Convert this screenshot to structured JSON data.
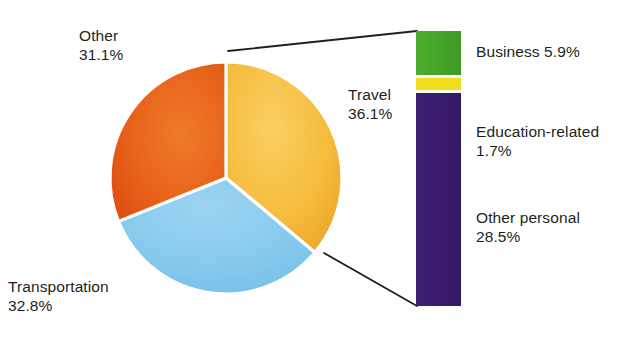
{
  "chart_data": {
    "type": "pie",
    "title": "",
    "subtitle": "",
    "xlabel": "",
    "ylabel": "",
    "legend_position": "right",
    "grid": false,
    "units": "percent",
    "categories": [
      "Travel",
      "Transportation",
      "Other"
    ],
    "values": [
      36.1,
      32.8,
      31.1
    ],
    "colors": [
      "#f5bc3c",
      "#82c8ec",
      "#e8631a"
    ],
    "start_angle_deg": 0,
    "direction": "clockwise",
    "exploded_category": "Travel",
    "breakout": {
      "type": "bar",
      "orientation": "vertical-stacked",
      "of_category": "Travel",
      "total": 36.1,
      "categories": [
        "Business",
        "Education-related",
        "Other personal"
      ],
      "values": [
        5.9,
        1.7,
        28.5
      ],
      "colors": [
        "#45a52a",
        "#f2dd1e",
        "#3b1c6e"
      ]
    }
  },
  "pie": {
    "slices": [
      {
        "name": "travel",
        "label": "Travel",
        "percent": "36.1%",
        "color": "#f5bc3c"
      },
      {
        "name": "transportation",
        "label": "Transportation",
        "percent": "32.8%",
        "color": "#82c8ec"
      },
      {
        "name": "other",
        "label": "Other",
        "percent": "31.1%",
        "color": "#e8631a"
      }
    ]
  },
  "bar": {
    "segments": [
      {
        "name": "business",
        "label": "Business",
        "percent": "5.9%",
        "color": "#45a52a"
      },
      {
        "name": "education-related",
        "label": "Education-related",
        "percent": "1.7%",
        "color": "#f2dd1e"
      },
      {
        "name": "other-personal",
        "label": "Other personal",
        "percent": "28.5%",
        "color": "#3b1c6e"
      }
    ]
  },
  "labels": {
    "other_line1": "Other",
    "other_line2": "31.1%",
    "transportation_line1": "Transportation",
    "transportation_line2": "32.8%",
    "travel_line1": "Travel",
    "travel_line2": "36.1%",
    "business": "Business 5.9%",
    "education_line1": "Education-related",
    "education_line2": "1.7%",
    "otherpersonal_line1": "Other personal",
    "otherpersonal_line2": "28.5%"
  }
}
